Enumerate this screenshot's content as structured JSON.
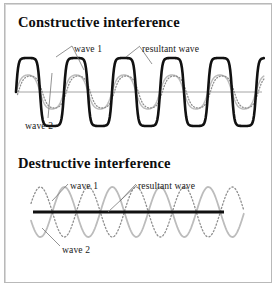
{
  "figure": {
    "width": 277,
    "height": 287,
    "background": "#ffffff",
    "border_color": "#b9b9b9"
  },
  "panels": [
    {
      "id": "constructive",
      "title": "Constructive interference",
      "labels": {
        "wave1": "wave 1",
        "wave2": "wave 2",
        "resultant": "resultant wave"
      }
    },
    {
      "id": "destructive",
      "title": "Destructive interference",
      "labels": {
        "wave1": "wave 1",
        "wave2": "wave 2",
        "resultant": "resultant wave"
      }
    }
  ],
  "colors": {
    "resultant_stroke": "#111111",
    "component_stroke": "#b6b6b6",
    "axis_stroke": "#9a9a9a",
    "leader_stroke": "#6e6e6e",
    "text": "#111111"
  },
  "chart_data": [
    {
      "type": "line",
      "title": "Constructive interference",
      "xlabel": "",
      "ylabel": "",
      "xlim": [
        0,
        277
      ],
      "ylim": [
        -1,
        1
      ],
      "grid": false,
      "legend_position": "inline-annotations",
      "axis_y_pixel": 92,
      "cycles": 4.4,
      "series": [
        {
          "name": "wave 1",
          "style": "solid",
          "color": "#b6b6b6",
          "amplitude": 0.5,
          "phase_deg": 0,
          "wavelength_px": 48
        },
        {
          "name": "wave 2",
          "style": "dotted",
          "color": "#b6b6b6",
          "amplitude": 0.5,
          "phase_deg": 0,
          "wavelength_px": 48
        },
        {
          "name": "resultant wave",
          "style": "solid-thick",
          "color": "#111111",
          "amplitude": 1.0,
          "phase_deg": 0,
          "wavelength_px": 48
        }
      ]
    },
    {
      "type": "line",
      "title": "Destructive interference",
      "xlabel": "",
      "ylabel": "",
      "xlim": [
        0,
        277
      ],
      "ylim": [
        -1,
        1
      ],
      "grid": false,
      "legend_position": "inline-annotations",
      "axis_y_pixel": 212,
      "cycles": 4.4,
      "series": [
        {
          "name": "wave 1",
          "style": "solid",
          "color": "#b6b6b6",
          "amplitude": 0.5,
          "phase_deg": 0,
          "wavelength_px": 48
        },
        {
          "name": "wave 2",
          "style": "dotted",
          "color": "#b6b6b6",
          "amplitude": 0.5,
          "phase_deg": 180,
          "wavelength_px": 48
        },
        {
          "name": "resultant wave",
          "style": "solid-thick",
          "color": "#111111",
          "amplitude": 0.0,
          "phase_deg": 0,
          "wavelength_px": 48
        }
      ]
    }
  ]
}
